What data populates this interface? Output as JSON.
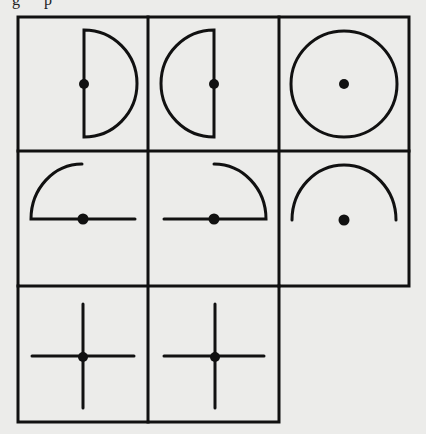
{
  "figure": {
    "caption_fragment": "g p",
    "colors": {
      "background": "#ececea",
      "ink": "#111111"
    },
    "grid": {
      "rows": 3,
      "cols": 3,
      "col_edges": [
        18,
        148,
        279,
        409
      ],
      "row_edges": [
        17,
        151,
        286,
        422
      ],
      "line_width": 3
    },
    "cells": [
      {
        "row": 1,
        "col": 1,
        "shape": "half-circle-right",
        "has_dot": true,
        "dot_position": "center-of-flat-edge"
      },
      {
        "row": 1,
        "col": 2,
        "shape": "half-circle-left",
        "has_dot": true,
        "dot_position": "center-of-flat-edge"
      },
      {
        "row": 1,
        "col": 3,
        "shape": "full-circle",
        "has_dot": true,
        "dot_position": "center"
      },
      {
        "row": 2,
        "col": 1,
        "shape": "horizontal-line-with-upper-left-quarter-arc",
        "has_dot": true,
        "dot_position": "center"
      },
      {
        "row": 2,
        "col": 2,
        "shape": "horizontal-line-with-upper-right-quarter-arc",
        "has_dot": true,
        "dot_position": "center"
      },
      {
        "row": 2,
        "col": 3,
        "shape": "upper-half-arc",
        "has_dot": true,
        "dot_position": "center"
      },
      {
        "row": 3,
        "col": 1,
        "shape": "cross",
        "has_dot": true,
        "dot_position": "center"
      },
      {
        "row": 3,
        "col": 2,
        "shape": "cross",
        "has_dot": true,
        "dot_position": "center"
      },
      {
        "row": 3,
        "col": 3,
        "shape": "empty",
        "has_dot": false,
        "dot_position": null
      }
    ]
  }
}
